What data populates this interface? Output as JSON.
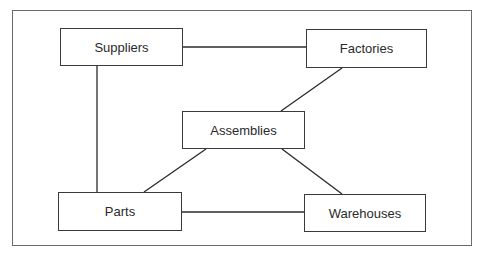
{
  "diagram": {
    "nodes": [
      {
        "id": "suppliers",
        "label": "Suppliers",
        "x": 60,
        "y": 28,
        "w": 123,
        "h": 38
      },
      {
        "id": "factories",
        "label": "Factories",
        "x": 306,
        "y": 29,
        "w": 121,
        "h": 39
      },
      {
        "id": "assemblies",
        "label": "Assemblies",
        "x": 182,
        "y": 111,
        "w": 123,
        "h": 38
      },
      {
        "id": "parts",
        "label": "Parts",
        "x": 58,
        "y": 192,
        "w": 124,
        "h": 39
      },
      {
        "id": "warehouses",
        "label": "Warehouses",
        "x": 304,
        "y": 194,
        "w": 122,
        "h": 38
      }
    ],
    "edges": [
      {
        "from": "suppliers",
        "to": "factories"
      },
      {
        "from": "suppliers",
        "to": "parts"
      },
      {
        "from": "factories",
        "to": "assemblies"
      },
      {
        "from": "assemblies",
        "to": "parts"
      },
      {
        "from": "assemblies",
        "to": "warehouses"
      },
      {
        "from": "parts",
        "to": "warehouses"
      }
    ],
    "colors": {
      "line": "#2a2a2a",
      "frame": "#6a6a6a",
      "background": "#ffffff"
    }
  }
}
